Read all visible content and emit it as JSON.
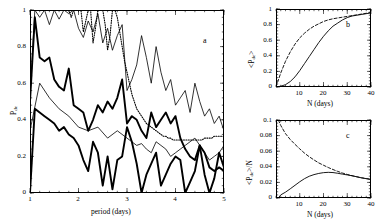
{
  "figure": {
    "background": "#ffffff",
    "ink": "#000000"
  },
  "panel_a": {
    "tag": "a",
    "xlabel": "period (days)",
    "ylabel_main": "P",
    "ylabel_sub": "de",
    "xticks": [
      "1",
      "2",
      "3",
      "4",
      "5"
    ],
    "yticks": [
      "0",
      "0.2",
      "0.4",
      "0.6",
      "0.8",
      "1"
    ],
    "xlim": [
      1,
      5
    ],
    "ylim": [
      0,
      1
    ]
  },
  "panel_b": {
    "tag": "b",
    "xlabel": "N  (days)",
    "ylabel_pre": "<P",
    "ylabel_sub": "de",
    "ylabel_post": ">",
    "xticks": [
      "10",
      "20",
      "30",
      "40"
    ],
    "yticks": [
      "0",
      "0.2",
      "0.4",
      "0.6",
      "0.8",
      "1"
    ],
    "xlim": [
      0,
      40
    ],
    "ylim": [
      0,
      1
    ]
  },
  "panel_c": {
    "tag": "c",
    "xlabel": "N  (days)",
    "ylabel_pre": "<P",
    "ylabel_sub": "de",
    "ylabel_post": ">/N",
    "xticks": [
      "10",
      "20",
      "30",
      "40"
    ],
    "yticks": [
      "0",
      "0.02",
      "0.04",
      "0.06",
      "0.08",
      "0.1"
    ],
    "xlim": [
      0,
      40
    ],
    "ylim": [
      0,
      0.1
    ]
  },
  "chart_data": [
    {
      "id": "panel_a",
      "type": "line",
      "title": "a",
      "xlabel": "period (days)",
      "ylabel": "P_de",
      "xlim": [
        1,
        5
      ],
      "ylim": [
        0,
        1
      ],
      "xticks": [
        1,
        2,
        3,
        4,
        5
      ],
      "yticks": [
        0,
        0.2,
        0.4,
        0.6,
        0.8,
        1
      ],
      "grid": false,
      "legend": "none",
      "series": [
        {
          "name": "dotted-upper",
          "style": "dotted",
          "x": [
            1.0,
            1.05,
            1.1,
            1.15,
            1.2,
            1.25,
            1.3,
            1.35,
            1.4,
            1.45,
            1.5,
            1.55,
            1.6,
            1.65,
            1.7,
            1.75,
            1.8,
            1.85,
            1.9,
            1.95,
            2.0,
            2.05,
            2.1,
            2.15,
            2.2,
            2.25,
            2.3,
            2.35,
            2.4,
            2.45,
            2.5,
            2.55,
            2.6,
            2.65,
            2.7,
            2.75,
            2.8,
            2.85,
            2.9,
            2.95,
            3.0,
            3.05,
            3.1,
            3.15,
            3.2,
            3.25,
            3.3,
            3.35,
            3.4,
            3.45,
            3.5,
            3.55,
            3.6,
            3.65,
            3.7,
            3.75,
            3.8,
            3.85,
            3.9,
            3.95,
            4.0,
            4.05,
            4.1,
            4.15,
            4.2,
            4.25,
            4.3,
            4.35,
            4.4,
            4.45,
            4.5,
            4.55,
            4.6,
            4.65,
            4.7,
            4.75,
            4.8,
            4.85,
            4.9,
            4.95,
            5.0
          ],
          "y": [
            1.0,
            1.0,
            1.0,
            1.0,
            1.0,
            1.0,
            1.0,
            1.0,
            1.0,
            1.0,
            1.0,
            1.0,
            1.0,
            1.0,
            1.0,
            1.0,
            1.0,
            0.96,
            1.0,
            1.0,
            1.0,
            1.0,
            0.88,
            0.94,
            1.0,
            1.0,
            0.82,
            0.9,
            1.0,
            1.0,
            1.0,
            0.92,
            0.78,
            0.86,
            1.0,
            1.0,
            0.96,
            0.88,
            0.8,
            0.72,
            0.66,
            0.6,
            0.54,
            0.5,
            0.46,
            0.44,
            0.42,
            0.4,
            0.38,
            0.37,
            0.36,
            0.35,
            0.34,
            0.33,
            0.32,
            0.31,
            0.31,
            0.3,
            0.3,
            0.29,
            0.29,
            0.29,
            0.29,
            0.29,
            0.29,
            0.29,
            0.29,
            0.29,
            0.29,
            0.29,
            0.29,
            0.29,
            0.3,
            0.3,
            0.3,
            0.3,
            0.31,
            0.31,
            0.31,
            0.31,
            0.31
          ]
        },
        {
          "name": "thin-solid",
          "style": "solid-thin",
          "x": [
            1.0,
            1.1,
            1.2,
            1.3,
            1.4,
            1.5,
            1.6,
            1.7,
            1.8,
            1.9,
            2.0,
            2.1,
            2.2,
            2.3,
            2.4,
            2.5,
            2.6,
            2.7,
            2.8,
            2.9,
            3.0,
            3.1,
            3.2,
            3.3,
            3.4,
            3.5,
            3.6,
            3.7,
            3.8,
            3.9,
            4.0,
            4.1,
            4.2,
            4.3,
            4.4,
            4.5,
            4.6,
            4.7,
            4.8,
            4.9,
            5.0
          ],
          "y": [
            0.52,
            1.0,
            0.96,
            1.0,
            0.92,
            1.0,
            0.95,
            1.0,
            0.98,
            1.0,
            0.9,
            0.85,
            0.94,
            0.88,
            0.98,
            0.82,
            0.9,
            0.78,
            0.86,
            0.92,
            0.56,
            0.62,
            0.7,
            0.86,
            0.74,
            0.6,
            0.8,
            0.66,
            0.56,
            0.62,
            0.48,
            0.52,
            0.56,
            0.44,
            0.6,
            0.5,
            0.42,
            0.46,
            0.38,
            0.42,
            0.34
          ]
        },
        {
          "name": "thick-solid-mid",
          "style": "solid-thick",
          "x": [
            1.0,
            1.1,
            1.2,
            1.3,
            1.4,
            1.5,
            1.6,
            1.7,
            1.8,
            1.9,
            2.0,
            2.1,
            2.2,
            2.3,
            2.4,
            2.5,
            2.6,
            2.7,
            2.8,
            2.9,
            3.0,
            3.1,
            3.2,
            3.3,
            3.4,
            3.5,
            3.6,
            3.7,
            3.8,
            3.9,
            4.0,
            4.1,
            4.2,
            4.3,
            4.4,
            4.5,
            4.6,
            4.7,
            4.8,
            4.9,
            5.0
          ],
          "y": [
            0.5,
            0.96,
            0.74,
            0.72,
            0.74,
            0.62,
            0.58,
            0.56,
            0.68,
            0.48,
            0.46,
            0.44,
            0.34,
            0.4,
            0.48,
            0.44,
            0.5,
            0.46,
            0.52,
            0.62,
            0.38,
            0.42,
            0.4,
            0.34,
            0.3,
            0.44,
            0.36,
            0.4,
            0.44,
            0.38,
            0.42,
            0.3,
            0.24,
            0.2,
            0.18,
            0.26,
            0.22,
            0.14,
            0.12,
            0.14,
            0.12
          ]
        },
        {
          "name": "thin-lower",
          "style": "solid-thin",
          "x": [
            1.0,
            1.2,
            1.4,
            1.6,
            1.8,
            2.0,
            2.2,
            2.4,
            2.6,
            2.8,
            3.0,
            3.1,
            3.2,
            3.3,
            3.4,
            3.5,
            3.6,
            3.7,
            3.8,
            3.9,
            4.0,
            4.1,
            4.2,
            4.3,
            4.4,
            4.5,
            4.6,
            4.7,
            4.8,
            4.9,
            5.0
          ],
          "y": [
            0.34,
            0.6,
            0.52,
            0.46,
            0.42,
            0.36,
            0.34,
            0.36,
            0.3,
            0.34,
            0.3,
            0.28,
            0.26,
            0.27,
            0.24,
            0.22,
            0.28,
            0.26,
            0.24,
            0.2,
            0.22,
            0.24,
            0.26,
            0.28,
            0.3,
            0.26,
            0.22,
            0.18,
            0.2,
            0.22,
            0.26
          ]
        },
        {
          "name": "thick-solid-lower",
          "style": "solid-thick",
          "x": [
            1.0,
            1.1,
            1.2,
            1.3,
            1.4,
            1.5,
            1.6,
            1.7,
            1.8,
            1.9,
            2.0,
            2.1,
            2.2,
            2.3,
            2.4,
            2.5,
            2.6,
            2.7,
            2.8,
            2.9,
            3.0,
            3.1,
            3.2,
            3.3,
            3.4,
            3.5,
            3.6,
            3.7,
            3.8,
            3.9,
            4.0,
            4.1,
            4.2,
            4.3,
            4.4,
            4.5,
            4.6,
            4.7,
            4.8,
            4.9,
            5.0
          ],
          "y": [
            0.0,
            0.46,
            0.44,
            0.42,
            0.4,
            0.38,
            0.34,
            0.36,
            0.32,
            0.3,
            0.26,
            0.18,
            0.12,
            0.28,
            0.22,
            0.04,
            0.2,
            0.02,
            0.18,
            0.2,
            0.36,
            0.28,
            0.16,
            0.0,
            0.1,
            0.16,
            0.22,
            0.04,
            0.1,
            0.16,
            0.2,
            0.18,
            0.0,
            0.06,
            0.12,
            0.26,
            0.1,
            0.0,
            0.08,
            0.22,
            0.14
          ]
        }
      ]
    },
    {
      "id": "panel_b",
      "type": "line",
      "title": "b",
      "xlabel": "N (days)",
      "ylabel": "<P_de>",
      "xlim": [
        0,
        40
      ],
      "ylim": [
        0,
        1
      ],
      "xticks": [
        10,
        20,
        30,
        40
      ],
      "yticks": [
        0,
        0.2,
        0.4,
        0.6,
        0.8,
        1
      ],
      "grid": false,
      "legend": "none",
      "series": [
        {
          "name": "solid",
          "style": "solid",
          "x": [
            0,
            2,
            4,
            6,
            8,
            10,
            12,
            14,
            16,
            18,
            20,
            22,
            24,
            26,
            28,
            30,
            32,
            34,
            36,
            38,
            40
          ],
          "y": [
            0.0,
            0.01,
            0.03,
            0.07,
            0.13,
            0.21,
            0.3,
            0.39,
            0.48,
            0.57,
            0.65,
            0.72,
            0.78,
            0.82,
            0.86,
            0.89,
            0.91,
            0.92,
            0.93,
            0.94,
            0.95
          ]
        },
        {
          "name": "dashed",
          "style": "dashed",
          "x": [
            0,
            2,
            4,
            6,
            8,
            10,
            12,
            14,
            16,
            18,
            20,
            22,
            24,
            26,
            28,
            30,
            32,
            34,
            36,
            38,
            40
          ],
          "y": [
            0.0,
            0.18,
            0.33,
            0.45,
            0.55,
            0.63,
            0.69,
            0.74,
            0.78,
            0.81,
            0.84,
            0.86,
            0.875,
            0.885,
            0.895,
            0.905,
            0.915,
            0.925,
            0.935,
            0.945,
            0.955
          ]
        }
      ]
    },
    {
      "id": "panel_c",
      "type": "line",
      "title": "c",
      "xlabel": "N (days)",
      "ylabel": "<P_de>/N",
      "xlim": [
        0,
        40
      ],
      "ylim": [
        0,
        0.1
      ],
      "xticks": [
        10,
        20,
        30,
        40
      ],
      "yticks": [
        0,
        0.02,
        0.04,
        0.06,
        0.08,
        0.1
      ],
      "grid": false,
      "legend": "none",
      "series": [
        {
          "name": "solid",
          "style": "solid",
          "x": [
            1,
            2,
            4,
            6,
            8,
            10,
            12,
            14,
            16,
            18,
            20,
            22,
            24,
            26,
            28,
            30,
            32,
            34,
            36,
            38,
            40
          ],
          "y": [
            0.0,
            0.004,
            0.0075,
            0.0118,
            0.0163,
            0.0208,
            0.0248,
            0.0279,
            0.03,
            0.0315,
            0.0325,
            0.0329,
            0.0326,
            0.0317,
            0.0306,
            0.0296,
            0.0285,
            0.0272,
            0.0258,
            0.0248,
            0.0238
          ]
        },
        {
          "name": "dashed",
          "style": "dashed",
          "x": [
            1,
            2,
            4,
            6,
            8,
            10,
            12,
            14,
            16,
            18,
            20,
            22,
            24,
            26,
            28,
            30,
            32,
            34,
            36,
            38,
            40
          ],
          "y": [
            0.1,
            0.093,
            0.0825,
            0.075,
            0.0688,
            0.063,
            0.0575,
            0.0529,
            0.0488,
            0.045,
            0.042,
            0.0391,
            0.0365,
            0.0341,
            0.032,
            0.0302,
            0.0286,
            0.0272,
            0.026,
            0.0249,
            0.0239
          ]
        }
      ]
    }
  ]
}
